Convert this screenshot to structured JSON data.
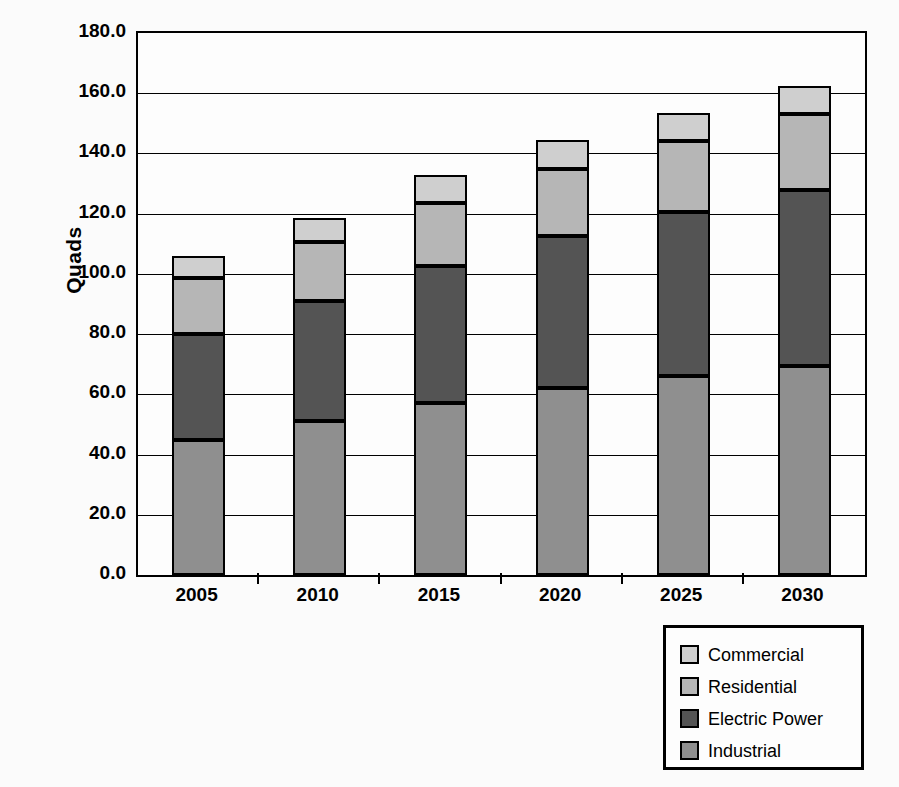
{
  "chart_data": {
    "type": "bar",
    "stacked": true,
    "title": "",
    "xlabel": "",
    "ylabel": "Quads",
    "categories": [
      "2005",
      "2010",
      "2015",
      "2020",
      "2025",
      "2030"
    ],
    "ylim": [
      0.0,
      180.0
    ],
    "ytick_step": 20.0,
    "yticks": [
      "180.0",
      "160.0",
      "140.0",
      "120.0",
      "100.0",
      "80.0",
      "60.0",
      "40.0",
      "20.0",
      "0.0"
    ],
    "ytick_values": [
      180.0,
      160.0,
      140.0,
      120.0,
      100.0,
      80.0,
      60.0,
      40.0,
      20.0,
      0.0
    ],
    "grid": true,
    "legend_position": "bottom-right",
    "series": [
      {
        "name": "Industrial",
        "color": "#8f8f8f",
        "values": [
          45.0,
          51.0,
          57.0,
          62.0,
          66.0,
          69.5
        ]
      },
      {
        "name": "Electric Power",
        "color": "#545454",
        "values": [
          35.0,
          40.0,
          45.5,
          50.5,
          54.5,
          58.5
        ]
      },
      {
        "name": "Residential",
        "color": "#b6b6b6",
        "values": [
          18.5,
          19.5,
          21.0,
          22.5,
          23.5,
          25.0
        ]
      },
      {
        "name": "Commercial",
        "color": "#cfcfcf",
        "values": [
          7.5,
          8.0,
          9.5,
          9.5,
          9.5,
          9.5
        ]
      }
    ],
    "stack_order_bottom_to_top": [
      "Industrial",
      "Electric Power",
      "Residential",
      "Commercial"
    ],
    "totals": [
      106.0,
      118.5,
      133.0,
      144.5,
      153.5,
      162.5
    ]
  },
  "legend": {
    "items": [
      {
        "label": "Commercial",
        "color": "#cfcfcf"
      },
      {
        "label": "Residential",
        "color": "#b6b6b6"
      },
      {
        "label": "Electric Power",
        "color": "#545454"
      },
      {
        "label": "Industrial",
        "color": "#8f8f8f"
      }
    ]
  }
}
